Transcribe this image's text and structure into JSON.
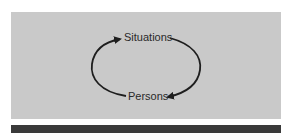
{
  "diagram": {
    "nodes": [
      {
        "id": "situations",
        "label": "Situations"
      },
      {
        "id": "persons",
        "label": "Persons"
      }
    ],
    "edges": [
      {
        "from": "persons",
        "to": "situations",
        "side": "left"
      },
      {
        "from": "situations",
        "to": "persons",
        "side": "right"
      }
    ],
    "colors": {
      "panel": "#c9c9c9",
      "bar": "#3a3a3a",
      "ink": "#1e1e1e"
    }
  }
}
